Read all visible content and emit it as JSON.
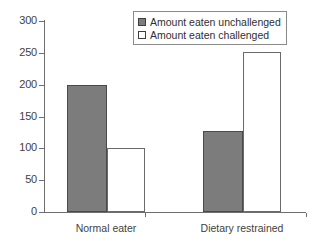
{
  "chart_data": {
    "type": "bar",
    "title": "",
    "subtitle": "",
    "xlabel": "",
    "ylabel": "",
    "categories": [
      "Normal eater",
      "Dietary restrained"
    ],
    "series": [
      {
        "name": "Amount eaten unchallenged",
        "values": [
          200,
          127
        ],
        "fill": "#7c7c7c",
        "swatch": "filled"
      },
      {
        "name": "Amount eaten challenged",
        "values": [
          100,
          251
        ],
        "fill": "#ffffff",
        "swatch": "hollow"
      }
    ],
    "ylim": [
      0,
      300
    ],
    "yticks": [
      0,
      50,
      100,
      150,
      200,
      250,
      300
    ],
    "ytick_labels": [
      "0",
      "50",
      "100",
      "150",
      "200",
      "250",
      "300"
    ],
    "grid": false,
    "legend_position": "top-right",
    "axis_color": "#6e6e6e",
    "bar_border_color": "#5c5c5c"
  },
  "legend": {
    "items": [
      {
        "label": "Amount eaten unchallenged",
        "swatch": "legend-swatch-filled"
      },
      {
        "label": "Amount eaten challenged",
        "swatch": "legend-swatch-hollow"
      }
    ]
  },
  "axes": {
    "y": {
      "labels": [
        "300",
        "250",
        "200",
        "150",
        "100",
        "50",
        "0"
      ]
    },
    "x": {
      "labels": [
        "Normal eater",
        "Dietary restrained"
      ]
    }
  }
}
